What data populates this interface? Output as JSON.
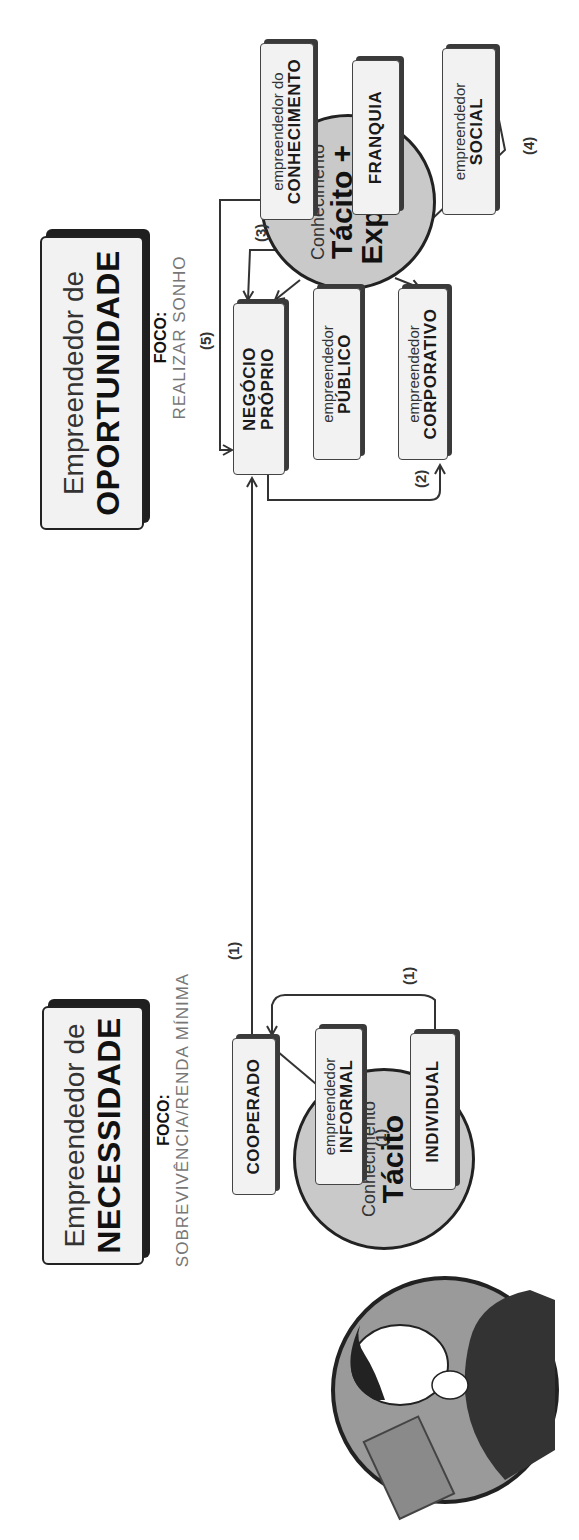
{
  "necessity": {
    "title_line1": "Empreendedor de",
    "title_line2": "NECESSIDADE",
    "focus_label": "FOCO:",
    "focus_value": "SOBREVIVÊNCIA/RENDA MÍNIMA",
    "knowledge_circle": {
      "line1": "Conhecimento",
      "line2": "Tácito"
    },
    "types": [
      {
        "id": "cooperado",
        "small": "",
        "big": "COOPERADO"
      },
      {
        "id": "informal",
        "small": "empreendedor",
        "big": "INFORMAL"
      },
      {
        "id": "individual",
        "small": "",
        "big": "INDIVIDUAL"
      }
    ]
  },
  "opportunity": {
    "title_line1": "Empreendedor de",
    "title_line2": "OPORTUNIDADE",
    "focus_label": "FOCO:",
    "focus_value": "REALIZAR SONHO",
    "knowledge_circle": {
      "line1": "Conhecimento",
      "line2": "Tácito +",
      "line3": "Explícito"
    },
    "types": [
      {
        "id": "negocio-proprio",
        "small": "",
        "big": "NEGÓCIO",
        "big2": "PRÓPRIO"
      },
      {
        "id": "publico",
        "small": "empreendedor",
        "big": "PÚBLICO"
      },
      {
        "id": "corporativo",
        "small": "empreendedor",
        "big": "CORPORATIVO"
      },
      {
        "id": "conhecimento",
        "small": "empreendedor do",
        "big": "CONHECIMENTO"
      },
      {
        "id": "franquia",
        "small": "",
        "big": "FRANQUIA"
      },
      {
        "id": "social",
        "small": "empreendedor",
        "big": "SOCIAL"
      }
    ]
  },
  "transitions": [
    {
      "label": "(1)",
      "from": "INFORMAL",
      "to": "INDIVIDUAL"
    },
    {
      "label": "(1)",
      "from": "INDIVIDUAL",
      "to": "COOPERADO"
    },
    {
      "label": "(1)",
      "from": "COOPERADO",
      "to": "NEGÓCIO PRÓPRIO"
    },
    {
      "label": "(2)",
      "from": "NEGÓCIO PRÓPRIO",
      "to": "CORPORATIVO"
    },
    {
      "label": "(3)",
      "from": "FRANQUIA",
      "to": "NEGÓCIO PRÓPRIO"
    },
    {
      "label": "(4)",
      "from": "PÚBLICO",
      "to": "SOCIAL"
    },
    {
      "label": "(5)",
      "from": "CONHECIMENTO",
      "to": "NEGÓCIO PRÓPRIO"
    }
  ],
  "colors": {
    "box_fill": "#f2f2f2",
    "circle_fill": "#c9c9c9",
    "line": "#444444",
    "shadow": "#2a2a2a"
  }
}
